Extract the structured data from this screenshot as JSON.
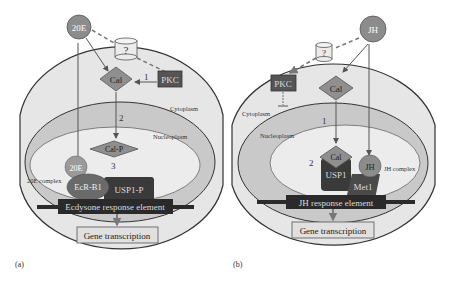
{
  "panels": [
    {
      "id": "a",
      "panel_label": "(a)",
      "hormone": "20E",
      "receptor": "?",
      "kinase": "PKC",
      "calponin": "Cal",
      "phospho_calponin": "Cal-P",
      "step_labels": [
        "1",
        "2",
        "3"
      ],
      "compartments": {
        "cytoplasm": "Cytoplasm",
        "nucleoplasm": "Nucleoplasm"
      },
      "complex_label": "20E complex",
      "complex_hormone": "20E",
      "partner1": "EcR-B1",
      "partner2": "USP1-P",
      "response_element": "Ecdysone response element",
      "output": "Gene transcription"
    },
    {
      "id": "b",
      "panel_label": "(b)",
      "hormone": "JH",
      "receptor": "?",
      "kinase": "PKC",
      "calponin": "Cal",
      "step_labels": [
        "1",
        "2"
      ],
      "compartments": {
        "cytoplasm": "Cytoplasm",
        "nucleoplasm": "Nucleoplasm"
      },
      "complex_label": "JH complex",
      "complex_hormone": "JH",
      "complex_cal": "Cal",
      "partner1": "USP1",
      "partner2": "Met1",
      "response_element": "JH response element",
      "output": "Gene transcription"
    }
  ],
  "colors": {
    "cell": "#e6e6e6",
    "nucleus_ring": "#c9c9c9",
    "nucleoplasm": "#ececec",
    "hormone": "#8c8c8c",
    "cal": "#8f8f8f",
    "pkc": "#555555",
    "dark_protein": "#3a3a3a",
    "element_bar": "#2a2a2a"
  }
}
